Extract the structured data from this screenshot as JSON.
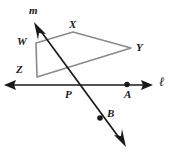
{
  "figure": {
    "background_color": "#ffffff",
    "line_color": "#1a1a1a",
    "shape_color": "#808080",
    "point_color": "#1a1a1a"
  },
  "labels": {
    "m": "m",
    "X": "X",
    "W": "W",
    "Y": "Y",
    "Z": "Z",
    "P": "P",
    "A": "A",
    "B": "B",
    "l": "ℓ"
  },
  "geometry": {
    "line_l": {
      "name": "l",
      "x1": 6,
      "y1": 85,
      "x2": 152,
      "y2": 85,
      "arrows": "both"
    },
    "line_m": {
      "name": "m",
      "x1": 36,
      "y1": 25,
      "x2": 124,
      "y2": 145,
      "arrows": "both"
    },
    "quadrilateral": {
      "name": "WXYZ",
      "vertices": [
        {
          "label": "W",
          "x": 36,
          "y": 43
        },
        {
          "label": "X",
          "x": 73,
          "y": 32
        },
        {
          "label": "Y",
          "x": 131,
          "y": 48
        },
        {
          "label": "Z",
          "x": 37,
          "y": 77
        }
      ]
    },
    "points": [
      {
        "label": "P",
        "x": 78,
        "y": 85,
        "dot": false
      },
      {
        "label": "A",
        "x": 127,
        "y": 85,
        "dot": true
      },
      {
        "label": "B",
        "x": 100,
        "y": 118,
        "dot": true
      }
    ]
  },
  "label_positions": {
    "m": {
      "x": 29,
      "y": 5
    },
    "X": {
      "x": 69,
      "y": 19
    },
    "W": {
      "x": 17,
      "y": 36
    },
    "Y": {
      "x": 136,
      "y": 42
    },
    "Z": {
      "x": 16,
      "y": 64
    },
    "P": {
      "x": 65,
      "y": 89
    },
    "A": {
      "x": 124,
      "y": 89
    },
    "B": {
      "x": 107,
      "y": 108
    },
    "l": {
      "x": 159,
      "y": 75
    }
  }
}
